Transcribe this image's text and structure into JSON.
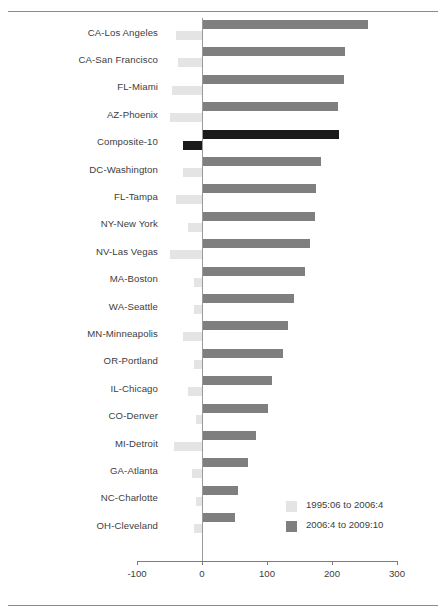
{
  "figure": {
    "has_top_rule": true,
    "has_bottom_rule": true
  },
  "legend": {
    "position": "bottom-right",
    "items": [
      {
        "label": "1995:06 to 2006:4",
        "color": "#e4e4e4",
        "name": "legend-series-1995-2006"
      },
      {
        "label": "2006:4 to 2009:10",
        "color": "#7f7f7f",
        "name": "legend-series-2006-2009"
      }
    ]
  },
  "axis": {
    "ticks": [
      {
        "label": "-100",
        "value": -100
      },
      {
        "label": "0",
        "value": 0
      },
      {
        "label": "100",
        "value": 100
      },
      {
        "label": "200",
        "value": 200
      },
      {
        "label": "300",
        "value": 300
      }
    ]
  },
  "chart_data": {
    "type": "bar",
    "orientation": "horizontal",
    "title": "",
    "subtitle": "",
    "xlabel": "",
    "ylabel": "",
    "xlim": [
      -120,
      310
    ],
    "grid": false,
    "legend_position": "bottom-right",
    "categories": [
      "CA-Los Angeles",
      "CA-San Francisco",
      "FL-Miami",
      "AZ-Phoenix",
      "Composite-10",
      "DC-Washington",
      "FL-Tampa",
      "NY-New York",
      "NV-Las Vegas",
      "MA-Boston",
      "WA-Seattle",
      "MN-Minneapolis",
      "OR-Portland",
      "IL-Chicago",
      "CO-Denver",
      "MI-Detroit",
      "GA-Atlanta",
      "NC-Charlotte",
      "OH-Cleveland"
    ],
    "highlight_category": "Composite-10",
    "highlight_color": "#1a1a1a",
    "series": [
      {
        "name": "2006:4 to 2009:10",
        "color": "#7f7f7f",
        "values": [
          255,
          220,
          218,
          209,
          210,
          183,
          175,
          174,
          166,
          158,
          142,
          132,
          124,
          107,
          101,
          83,
          71,
          56,
          50
        ]
      },
      {
        "name": "1995:06 to 2006:4",
        "color": "#e4e4e4",
        "values": [
          -40,
          -37,
          -46,
          -49,
          -30,
          -30,
          -40,
          -22,
          -49,
          -12,
          -13,
          -30,
          -12,
          -22,
          -10,
          -43,
          -16,
          -9,
          -12
        ]
      }
    ]
  }
}
